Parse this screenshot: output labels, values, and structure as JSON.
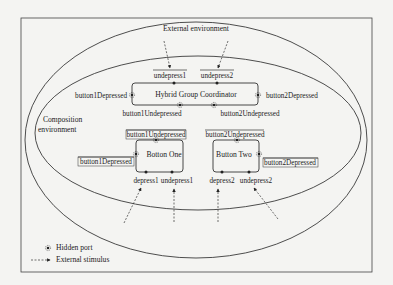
{
  "figure": {
    "external_environment_label": "External environment",
    "composition_environment_label_line1": "Composition",
    "composition_environment_label_line2": "environment",
    "coordinator": {
      "title": "Hybrid  Group Coordinator",
      "top_ports": [
        "undepress1",
        "undepress2"
      ],
      "left_port": "button1Depressed",
      "right_port": "button2Depressed",
      "bottom_ports": [
        "button1Undepressed",
        "button2Undepressed"
      ]
    },
    "button_one": {
      "title": "Botton One",
      "top_port": "button1Undepressed",
      "left_port": "button1Depressed",
      "bottom_ports": [
        "depress1",
        "undepress1"
      ]
    },
    "button_two": {
      "title": "Button Two",
      "top_port": "button2Undepressed",
      "right_port": "button2Depressed",
      "bottom_ports": [
        "depress2",
        "undepress2"
      ]
    },
    "legend": {
      "hidden_port": "Hidden port",
      "external_stimulus": "External stimulus"
    }
  },
  "colors": {
    "background": "#f4f4f2",
    "stroke": "#333333",
    "text": "#222222"
  }
}
